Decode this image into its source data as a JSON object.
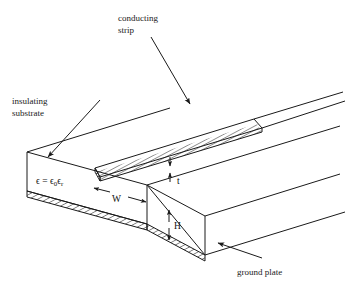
{
  "figure": {
    "kind": "microstrip-transmission-line-cross-section",
    "background_color": "#ffffff",
    "line_color": "#1a1a1a",
    "labels": {
      "conducting_strip_line1": "conducting",
      "conducting_strip_line2": "strip",
      "insulating_substrate_line1": "insulating",
      "insulating_substrate_line2": "substrate",
      "ground_plate": "ground plate"
    },
    "dimensions": {
      "width_symbol": "W",
      "height_symbol": "H",
      "thickness_symbol": "t"
    },
    "permittivity": {
      "lhs": "ϵ",
      "equals": "=",
      "eps0_base": "ϵ",
      "eps0_sub": "0",
      "epsr_base": "ϵ",
      "epsr_sub": "r",
      "full_text": "ϵ = ϵ₀ϵᵣ"
    }
  }
}
